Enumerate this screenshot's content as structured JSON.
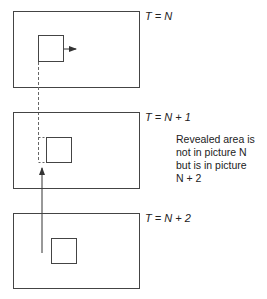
{
  "frames": [
    {
      "label": "T = N"
    },
    {
      "label": "T = N + 1"
    },
    {
      "label": "T = N + 2"
    }
  ],
  "annotation": {
    "lines": [
      "Revealed area is",
      "not in picture N",
      "but is in picture",
      "N + 2"
    ]
  },
  "colors": {
    "stroke": "#444444",
    "background": "#ffffff"
  }
}
